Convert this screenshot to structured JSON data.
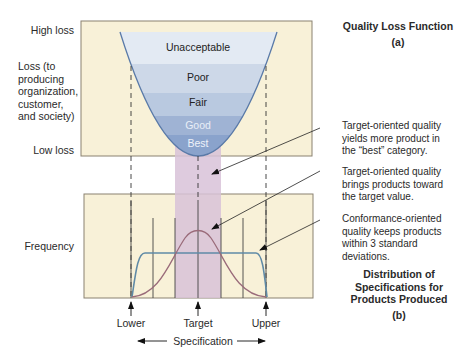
{
  "top_panel": {
    "y_axis": {
      "high": "High loss",
      "middle": "Loss (to producing organization, customer, and society)",
      "middle_lines": [
        "Loss (to",
        "producing",
        "organization,",
        "customer,",
        "and society)"
      ],
      "low": "Low loss"
    },
    "bands": [
      "Unacceptable",
      "Poor",
      "Fair",
      "Good",
      "Best"
    ],
    "title": "Quality Loss Function",
    "label": "(a)"
  },
  "bottom_panel": {
    "y_axis": "Frequency",
    "x_ticks": [
      "Lower",
      "Target",
      "Upper"
    ],
    "x_axis": "Specification",
    "title_lines": [
      "Distribution of",
      "Specifications for",
      "Products Produced"
    ],
    "label": "(b)"
  },
  "annotations": [
    {
      "lines": [
        "Target-oriented quality",
        "yields more product in",
        "the “best” category."
      ]
    },
    {
      "lines": [
        "Target-oriented quality",
        "brings products toward",
        "the target value."
      ]
    },
    {
      "lines": [
        "Conformance-oriented",
        "quality keeps products",
        "within 3 standard",
        "deviations."
      ]
    }
  ],
  "colors": {
    "panel_bg": "#f8f1d8",
    "panel_border": "#8a8170",
    "band_unacceptable": "#e3eaf3",
    "band_poor": "#cdd8e8",
    "band_fair": "#b9c9e0",
    "band_good": "#9fb3d4",
    "band_best": "#8aa3cc",
    "parabola": "#5a7aa8",
    "pink_band": "#d8c2d8",
    "normal_curve": "#9a6b7a",
    "uniform_curve": "#5f8aa6"
  }
}
